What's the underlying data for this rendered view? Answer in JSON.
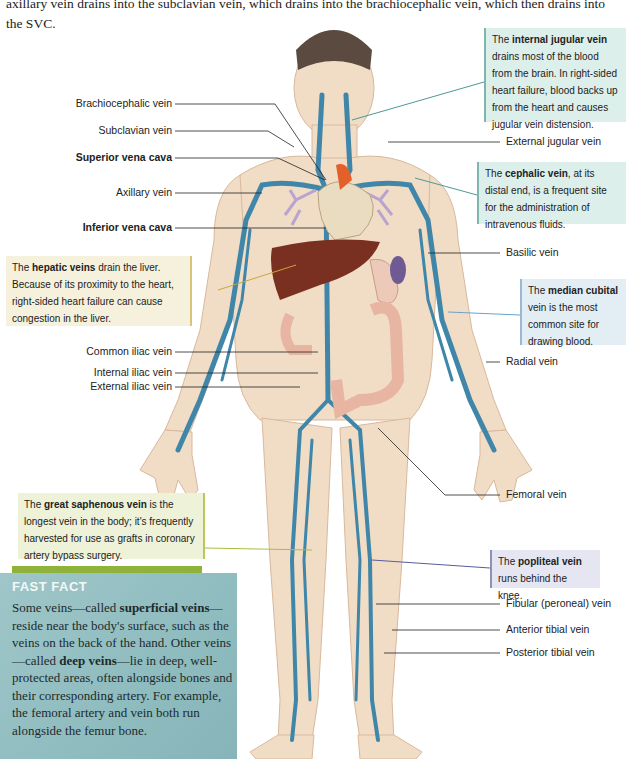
{
  "intro_text": "axillary vein drains into the subclavian vein, which drains into the brachiocephalic vein, which then drains into the SVC.",
  "left_labels": [
    {
      "text": "Brachiocephalic vein",
      "bold": false
    },
    {
      "text": "Subclavian vein",
      "bold": false
    },
    {
      "text": "Superior vena cava",
      "bold": true
    },
    {
      "text": "Axillary vein",
      "bold": false
    },
    {
      "text": "Inferior vena cava",
      "bold": true
    },
    {
      "text": "Common iliac vein",
      "bold": false
    },
    {
      "text": "Internal iliac vein",
      "bold": false
    },
    {
      "text": "External iliac vein",
      "bold": false
    }
  ],
  "right_labels": [
    {
      "text": "External jugular vein"
    },
    {
      "text": "Basilic vein"
    },
    {
      "text": "Radial vein"
    },
    {
      "text": "Femoral  vein"
    },
    {
      "text": "Fibular (peroneal) vein"
    },
    {
      "text": "Anterior tibial vein"
    },
    {
      "text": "Posterior tibial vein"
    }
  ],
  "callouts": {
    "internal_jugular": {
      "pre": "The ",
      "bold": "internal jugular vein",
      "post": " drains most of the blood from the brain. In right-sided heart failure, blood backs up from the heart and causes jugular vein distension."
    },
    "cephalic": {
      "pre": "The ",
      "bold": "cephalic vein",
      "post": ", at its distal end, is a frequent site for the administration of intravenous fluids."
    },
    "median_cubital": {
      "pre": "The ",
      "bold": "median cubital",
      "post": " vein is the most common site for drawing blood."
    },
    "hepatic": {
      "pre": "The ",
      "bold": "hepatic veins",
      "post": "  drain the liver. Because of its proximity to the heart, right-sided heart failure can cause congestion in the liver."
    },
    "great_saphenous": {
      "pre": "The ",
      "bold": "great saphenous vein",
      "post": " is the longest vein in the body; it's frequently harvested for use as grafts in coronary artery bypass surgery."
    },
    "popliteal": {
      "pre": "The ",
      "bold": "popliteal vein",
      "post": " runs behind the knee."
    }
  },
  "fast_fact": {
    "title": "FAST FACT",
    "t1": "Some veins—called ",
    "b1": "superficial veins",
    "t2": "—reside near the body's surface, such as the veins on the back of the hand. Other veins—called ",
    "b2": "deep veins",
    "t3": "—lie in deep, well-protected areas, often alongside bones and their corresponding artery. For example, the femoral artery and vein both run alongside the femur bone."
  },
  "colors": {
    "skin": "#f1dcc6",
    "vein": "#3f86a8",
    "liver": "#7a3020",
    "heart": "#e9dcc0",
    "aorta": "#e4602a",
    "lung": "#b9a3cf",
    "intestine": "#e8b5a2",
    "spleen": "#6f5a93"
  }
}
